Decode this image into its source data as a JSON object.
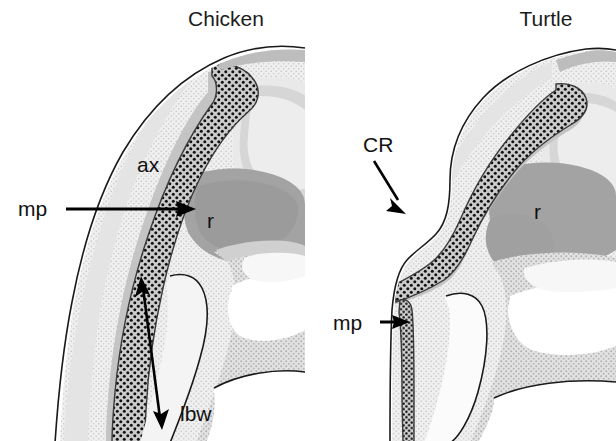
{
  "figure": {
    "type": "scientific-diagram",
    "background_color": "#ffffff",
    "panel_count": 2
  },
  "panels": [
    {
      "id": "chicken",
      "title": "Chicken",
      "title_x": 226,
      "title_y": 26,
      "annotations": [
        {
          "name": "ax",
          "label": "ax",
          "x": 137,
          "y": 172,
          "kind": "inline-text"
        },
        {
          "name": "r",
          "label": "r",
          "x": 207,
          "y": 228,
          "kind": "inline-text"
        },
        {
          "name": "mp",
          "label": "mp",
          "x": 18,
          "y": 216,
          "kind": "arrow-label"
        },
        {
          "name": "lbw",
          "label": "lbw",
          "x": 180,
          "y": 421,
          "kind": "arrow-label"
        }
      ]
    },
    {
      "id": "turtle",
      "title": "Turtle",
      "title_x": 546,
      "title_y": 26,
      "annotations": [
        {
          "name": "CR",
          "label": "CR",
          "x": 363,
          "y": 152,
          "kind": "arrow-label"
        },
        {
          "name": "r",
          "label": "r",
          "x": 534,
          "y": 219,
          "kind": "inline-text"
        },
        {
          "name": "mp",
          "label": "mp",
          "x": 333,
          "y": 330,
          "kind": "arrow-label"
        }
      ]
    }
  ],
  "legend_keys": {
    "ax": "axial / somatic mesenchyme region",
    "r": "ridge region",
    "mp": "marginal / mesodermal plate band",
    "lbw": "lateral body wall",
    "CR": "carapacial ridge"
  },
  "colors": {
    "background": "#ffffff",
    "outline": "#1a1a1a",
    "tissue_light": "#ececec",
    "tissue_mid": "#d9d9d9",
    "tissue_dark": "#a8a8a8",
    "tissue_darker": "#8e8e8e",
    "stipple_band_fill": "#c9c9c9",
    "stipple_dot": "#111111",
    "label_text": "#111111",
    "title_text": "#1c1c1c"
  }
}
